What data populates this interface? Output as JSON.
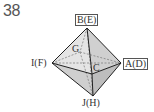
{
  "problem_number": "38",
  "figure": {
    "type": "octahedron",
    "vertices": {
      "top": {
        "label": "B(E)",
        "boxed": true
      },
      "right": {
        "label": "A(D)",
        "boxed": true
      },
      "left": {
        "label": "I(F)",
        "boxed": false
      },
      "bottom": {
        "label": "J(H)",
        "boxed": false
      },
      "front": {
        "label": "C",
        "boxed": false
      },
      "back": {
        "label": "G",
        "boxed": false
      }
    },
    "colors": {
      "face_light": "#e6e6e6",
      "face_mid": "#d2d2d2",
      "face_dark": "#bdbdbd",
      "edge": "#222222",
      "hidden_edge": "#777777"
    }
  }
}
